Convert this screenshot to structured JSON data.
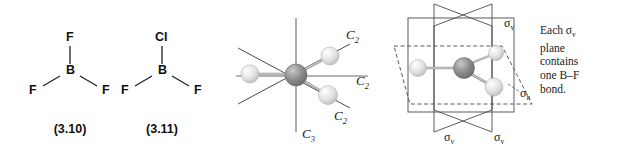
{
  "figure": {
    "background": "#ffffff",
    "line_color": "#3a3a3a",
    "bond_color": "#6e6e6e",
    "central_atom_color": "#8a8a8a",
    "terminal_atom_color": "#d8d8d8"
  },
  "lewis_structures": [
    {
      "id": "bf3",
      "caption": "(3.10)",
      "central": "B",
      "top": "F",
      "left": "F",
      "right": "F"
    },
    {
      "id": "bclf2",
      "caption": "(3.11)",
      "central": "B",
      "top": "Cl",
      "left": "F",
      "right": "F"
    }
  ],
  "axes_panel": {
    "name": "rotation-axes-diagram",
    "principal_axis_label": "C",
    "principal_axis_sub": "3",
    "c2_labels": [
      {
        "label": "C",
        "sub": "2"
      },
      {
        "label": "C",
        "sub": "2"
      },
      {
        "label": "C",
        "sub": "2"
      }
    ]
  },
  "planes_panel": {
    "name": "mirror-planes-diagram",
    "sigma_v_labels": [
      {
        "label": "σ",
        "sub": "v"
      },
      {
        "label": "σ",
        "sub": "v"
      },
      {
        "label": "σ",
        "sub": "v"
      }
    ],
    "sigma_h_label": {
      "label": "σ",
      "sub": "h"
    }
  },
  "caption_text": {
    "line1_prefix": "Each ",
    "line1_sigma": "σ",
    "line1_sub": "v",
    "line2": "plane",
    "line3": "contains",
    "line4": "one B–F",
    "line5": "bond."
  }
}
